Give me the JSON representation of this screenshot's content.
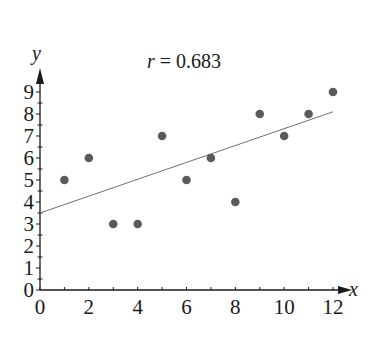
{
  "chart_data": {
    "type": "scatter",
    "title": "",
    "xlabel": "x",
    "ylabel": "y",
    "xlim": [
      0,
      12
    ],
    "ylim": [
      0,
      9
    ],
    "x_ticks": [
      0,
      2,
      4,
      6,
      8,
      10,
      12
    ],
    "y_ticks": [
      0,
      1,
      2,
      3,
      4,
      5,
      6,
      7,
      8,
      9
    ],
    "grid": false,
    "legend": null,
    "series": [
      {
        "name": "data",
        "x": [
          1,
          2,
          3,
          4,
          5,
          6,
          7,
          8,
          9,
          10,
          11,
          12
        ],
        "y": [
          5,
          6,
          3,
          3,
          7,
          5,
          6,
          4,
          8,
          7,
          8,
          9
        ]
      }
    ],
    "trendline": {
      "type": "linear",
      "x_start": 0,
      "y_start": 3.5,
      "x_end": 12,
      "y_end": 8.1
    },
    "annotations": [
      {
        "text_var": "r",
        "text_rest": " = 0.683",
        "label": "r = 0.683"
      }
    ],
    "colors": {
      "points": "#5a5a5a",
      "line": "#707070",
      "axis": "#1a1a1a"
    }
  }
}
